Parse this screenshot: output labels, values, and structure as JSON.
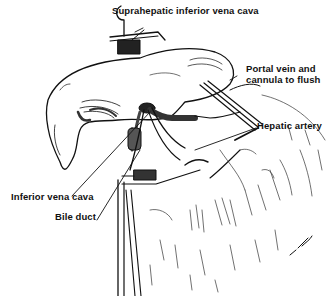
{
  "figure": {
    "labels": {
      "suprahepatic_ivc": "Suprahepatic inferior vena cava",
      "portal_vein_line1": "Portal vein and",
      "portal_vein_line2": "cannula to flush",
      "hepatic_artery": "Hepatic artery",
      "inferior_vena_cava": "Inferior vena cava",
      "bile_duct": "Bile duct"
    },
    "signature": "J. Lees"
  }
}
